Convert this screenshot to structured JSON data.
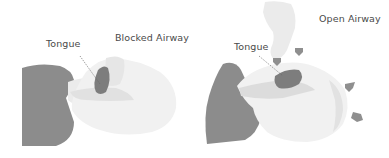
{
  "diagrams": [
    {
      "title": "Blocked Airway",
      "pointer_label": "Tongue"
    },
    {
      "title": "Open Airway",
      "pointer_label": "Tongue"
    }
  ],
  "colors": {
    "shoulder": "#8c8c8c",
    "tongue": "#7d7d7d",
    "head_skin": "#f1f1f1",
    "head_shade": "#e4e4e4",
    "airway_shade": "#dcdcdc",
    "hand": "#ebebeb",
    "arrow": "#8f8f8f",
    "pointer_line": "#666666",
    "text": "#4a4a4a"
  }
}
